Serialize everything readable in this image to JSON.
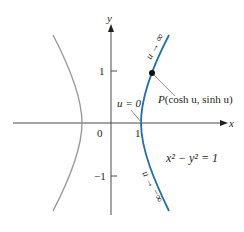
{
  "figure": {
    "equation": "x² − y² = 1",
    "axes": {
      "x_label": "x",
      "y_label": "y",
      "origin_label": "0",
      "x_ticks": [
        {
          "value": 1,
          "label": "1"
        }
      ],
      "y_ticks": [
        {
          "value": 1,
          "label": "1"
        },
        {
          "value": -1,
          "label": "−1"
        }
      ]
    },
    "point": {
      "name": "P",
      "label": "P(cosh u, sinh u)",
      "label_prefix": "P",
      "label_args": "(cosh u, sinh u)"
    },
    "annotations": {
      "u_zero": "u = 0",
      "u_pos_inf": "u → ∞",
      "u_neg_inf": "u → −∞"
    },
    "colors": {
      "right_branch": "#1f6fb2",
      "left_branch": "#9a9a9a",
      "axes": "#4a4a4a",
      "text": "#231f20",
      "leader": "#8a8a8a"
    }
  }
}
